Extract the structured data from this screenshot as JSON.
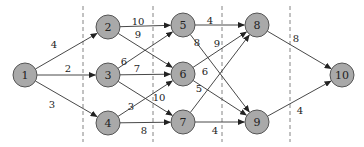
{
  "diagram": {
    "type": "staged-directed-graph",
    "colors": {
      "node_fill": "#a9a9a9",
      "node_stroke": "#555555",
      "edge": "#333333",
      "stage_divider": "#777777"
    },
    "node_radius": 12,
    "stage_dividers_x": [
      83,
      153,
      222,
      290
    ],
    "nodes": [
      {
        "id": "1",
        "label": "1",
        "x": 25,
        "y": 75
      },
      {
        "id": "2",
        "label": "2",
        "x": 108,
        "y": 27
      },
      {
        "id": "3",
        "label": "3",
        "x": 108,
        "y": 75
      },
      {
        "id": "4",
        "label": "4",
        "x": 108,
        "y": 123
      },
      {
        "id": "5",
        "label": "5",
        "x": 183,
        "y": 25
      },
      {
        "id": "6",
        "label": "6",
        "x": 183,
        "y": 74
      },
      {
        "id": "7",
        "label": "7",
        "x": 183,
        "y": 122
      },
      {
        "id": "8",
        "label": "8",
        "x": 257,
        "y": 25
      },
      {
        "id": "9",
        "label": "9",
        "x": 257,
        "y": 122
      },
      {
        "id": "10",
        "label": "10",
        "x": 342,
        "y": 75
      }
    ],
    "edges": [
      {
        "from": "1",
        "to": "2",
        "weight": "4",
        "lx": 54,
        "ly": 44
      },
      {
        "from": "1",
        "to": "3",
        "weight": "2",
        "lx": 68,
        "ly": 68
      },
      {
        "from": "1",
        "to": "4",
        "weight": "3",
        "lx": 52,
        "ly": 104
      },
      {
        "from": "2",
        "to": "5",
        "weight": "10",
        "lx": 138,
        "ly": 21
      },
      {
        "from": "2",
        "to": "6",
        "weight": "9",
        "lx": 138,
        "ly": 34
      },
      {
        "from": "3",
        "to": "5",
        "weight": "6",
        "lx": 124,
        "ly": 61
      },
      {
        "from": "3",
        "to": "6",
        "weight": "7",
        "lx": 137,
        "ly": 68
      },
      {
        "from": "3",
        "to": "7",
        "weight": "10",
        "lx": 159,
        "ly": 97
      },
      {
        "from": "4",
        "to": "6",
        "weight": "3",
        "lx": 131,
        "ly": 106
      },
      {
        "from": "4",
        "to": "7",
        "weight": "8",
        "lx": 144,
        "ly": 130
      },
      {
        "from": "5",
        "to": "8",
        "weight": "4",
        "lx": 210,
        "ly": 20
      },
      {
        "from": "5",
        "to": "9",
        "weight": "8",
        "lx": 197,
        "ly": 42
      },
      {
        "from": "6",
        "to": "8",
        "weight": "6",
        "lx": 205,
        "ly": 71
      },
      {
        "from": "6",
        "to": "9",
        "weight": "5",
        "lx": 199,
        "ly": 88
      },
      {
        "from": "7",
        "to": "8",
        "weight": "9",
        "lx": 217,
        "ly": 43
      },
      {
        "from": "7",
        "to": "9",
        "weight": "4",
        "lx": 215,
        "ly": 130
      },
      {
        "from": "8",
        "to": "10",
        "weight": "8",
        "lx": 296,
        "ly": 38
      },
      {
        "from": "9",
        "to": "10",
        "weight": "4",
        "lx": 300,
        "ly": 110
      }
    ]
  }
}
